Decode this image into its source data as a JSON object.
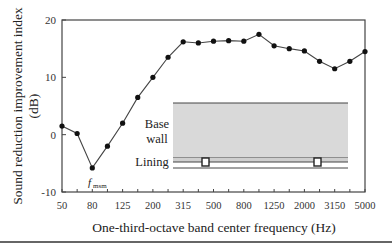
{
  "chart_data": {
    "type": "line",
    "title": "",
    "xlabel": "One-third-octave band center frequency (Hz)",
    "ylabel": "Sound reduction improvement index (dB)",
    "ylabel_line1": "Sound reduction improvement index",
    "ylabel_line2": "(dB)",
    "ylim": [
      -10,
      20
    ],
    "yticks": [
      -10,
      0,
      10,
      20
    ],
    "x": [
      "50",
      "63",
      "80",
      "100",
      "125",
      "160",
      "200",
      "250",
      "315",
      "400",
      "500",
      "630",
      "800",
      "1000",
      "1250",
      "1600",
      "2000",
      "2500",
      "3150",
      "4000",
      "5000"
    ],
    "xtick_labels": [
      "50",
      "80",
      "125",
      "200",
      "315",
      "500",
      "800",
      "1250",
      "2000",
      "3150",
      "5000"
    ],
    "series": [
      {
        "name": "Sound reduction improvement index",
        "values": [
          1.5,
          0.2,
          -5.8,
          -2.0,
          2.0,
          6.5,
          10.0,
          13.5,
          16.2,
          16.0,
          16.3,
          16.4,
          16.3,
          17.5,
          15.5,
          15.0,
          14.6,
          12.8,
          11.5,
          12.8,
          14.5
        ]
      }
    ],
    "annotations": [
      {
        "text": "f",
        "subscript": "msm",
        "x": "80"
      }
    ],
    "grid": false,
    "legend": null
  },
  "inset": {
    "base_wall_label_1": "Base",
    "base_wall_label_2": "wall",
    "lining_label": "Lining"
  },
  "colors": {
    "line": "#444444",
    "marker": "#111111",
    "axis": "#444444",
    "wall_fill": "#d9d9d9"
  }
}
